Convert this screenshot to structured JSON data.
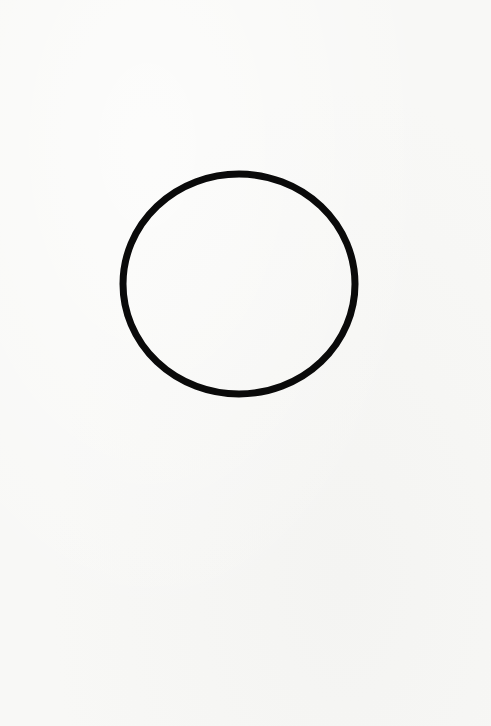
{
  "canvas": {
    "width": 491,
    "height": 726,
    "background_color": "#f8f8f6"
  },
  "shape": {
    "type": "circle-outline",
    "center_x": 239,
    "center_y": 284,
    "radius_x": 116,
    "radius_y": 110,
    "stroke_width": 7,
    "stroke_color": "#0a0a0a",
    "fill": "none"
  }
}
